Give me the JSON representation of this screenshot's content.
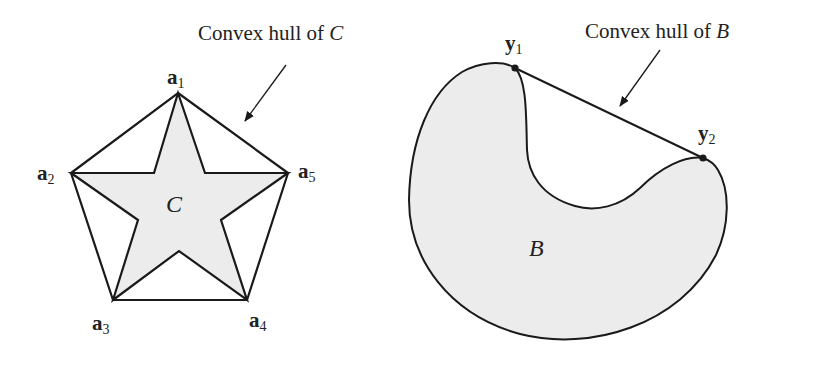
{
  "figure_left": {
    "annotation": {
      "text": "Convex hull of ",
      "symbol": "C"
    },
    "set_label": "C",
    "vertices": [
      {
        "name": "a",
        "sub": "1"
      },
      {
        "name": "a",
        "sub": "2"
      },
      {
        "name": "a",
        "sub": "3"
      },
      {
        "name": "a",
        "sub": "4"
      },
      {
        "name": "a",
        "sub": "5"
      }
    ]
  },
  "figure_right": {
    "annotation": {
      "text": "Convex hull of ",
      "symbol": "B"
    },
    "set_label": "B",
    "points": [
      {
        "name": "y",
        "sub": "1"
      },
      {
        "name": "y",
        "sub": "2"
      }
    ]
  },
  "colors": {
    "fill": "#ececec",
    "stroke": "#1a1a1a",
    "background": "#ffffff"
  }
}
